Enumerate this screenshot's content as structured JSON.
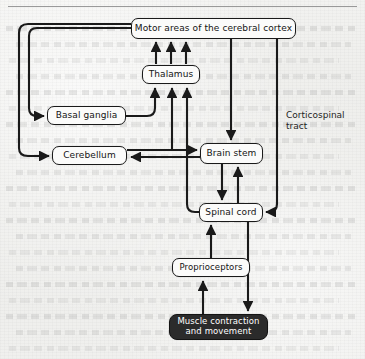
{
  "figure": {
    "nodes": {
      "cortex": "Motor areas of the cerebral cortex",
      "thalamus": "Thalamus",
      "basal_ganglia": "Basal ganglia",
      "cerebellum": "Cerebellum",
      "brain_stem": "Brain stem",
      "spinal_cord": "Spinal cord",
      "proprioceptors": "Proprioceptors",
      "muscle": "Muscle contraction and movement"
    },
    "labels": {
      "corticospinal_tract": "Corticospinal\ntract"
    },
    "colors": {
      "line": "#1a1a1a",
      "box_fill": "#fbfbfa",
      "box_stroke": "#1a1a1a",
      "dark_box_fill": "#2b2b2b",
      "dark_box_text": "#ffffff",
      "page": "#efefed"
    },
    "edges": [
      {
        "from": "cortex",
        "to": "basal_ganglia",
        "style": "elbow-left"
      },
      {
        "from": "cortex",
        "to": "cerebellum",
        "style": "elbow-left-outer"
      },
      {
        "from": "basal_ganglia",
        "to": "thalamus",
        "style": "elbow-right"
      },
      {
        "from": "thalamus",
        "to": "cortex",
        "style": "vertical-triple"
      },
      {
        "from": "cerebellum",
        "to": "thalamus",
        "style": "vertical"
      },
      {
        "from": "spinal_cord",
        "to": "thalamus",
        "style": "vertical-long"
      },
      {
        "from": "cortex",
        "to": "brain_stem",
        "style": "vertical"
      },
      {
        "from": "brain_stem",
        "to": "cerebellum",
        "style": "horizontal-left"
      },
      {
        "from": "cerebellum",
        "to": "brain_stem",
        "style": "horizontal-right"
      },
      {
        "from": "brain_stem",
        "to": "spinal_cord",
        "style": "vertical"
      },
      {
        "from": "spinal_cord",
        "to": "brain_stem",
        "style": "vertical-up"
      },
      {
        "from": "cortex",
        "to": "spinal_cord",
        "style": "corticospinal-right"
      },
      {
        "from": "spinal_cord",
        "to": "muscle",
        "style": "vertical-down"
      },
      {
        "from": "muscle",
        "to": "proprioceptors",
        "style": "vertical-up"
      },
      {
        "from": "proprioceptors",
        "to": "spinal_cord",
        "style": "vertical-up"
      }
    ]
  }
}
